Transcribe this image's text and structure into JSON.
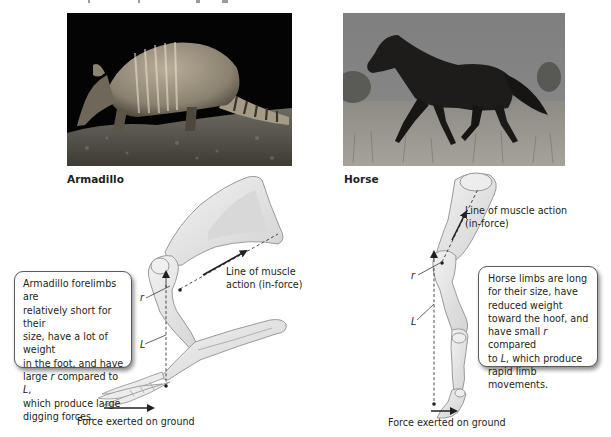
{
  "figure": {
    "top_cutoff_text": "",
    "panels": [
      {
        "id": "armadillo",
        "photo_label": "Armadillo",
        "photo_description": "nine-banded armadillo on dark background",
        "muscle_line_label": "Line of muscle action (in-force)",
        "muscle_line_label_lines": [
          "Line of muscle",
          "action (in-force)"
        ],
        "r_label": "r",
        "L_label": "L",
        "ground_force_label": "Force exerted on ground",
        "callout": {
          "lines": [
            "Armadillo forelimbs are",
            "relatively short for their",
            "size, have a lot of weight",
            "in the foot, and have",
            "large ",
            " compared to ",
            ",",
            "which produce large",
            "digging forces."
          ],
          "text": "Armadillo forelimbs are relatively short for their size, have a lot of weight in the foot, and have large r compared to L, which produce large digging forces."
        }
      },
      {
        "id": "horse",
        "photo_label": "Horse",
        "photo_description": "dark horse trotting in grassland",
        "muscle_line_label": "Line of muscle action (in-force)",
        "muscle_line_label_lines": [
          "Line of muscle action",
          "(in-force)"
        ],
        "r_label": "r",
        "L_label": "L",
        "ground_force_label": "Force exerted on ground",
        "callout": {
          "lines": [
            "Horse limbs are long",
            "for their size, have",
            "reduced weight",
            "toward the hoof, and",
            "have small ",
            " compared",
            "to ",
            ", which produce",
            "rapid limb movements."
          ],
          "text": "Horse limbs are long for their size, have reduced weight toward the hoof, and have small r compared to L, which produce rapid limb movements."
        }
      }
    ]
  },
  "colors": {
    "bone_fill": "#e9e9e9",
    "bone_stroke": "#9a9a9a",
    "bone_shade": "#cfcfcf",
    "line": "#231f20",
    "callout_border": "#5a5a5a"
  }
}
